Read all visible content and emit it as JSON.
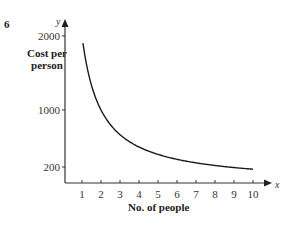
{
  "question_number": "6",
  "chart_data": {
    "type": "line",
    "title": "",
    "xlabel": "No. of people",
    "ylabel": "Cost per person",
    "x_axis_symbol": "x",
    "y_axis_symbol": "y",
    "x_ticks": [
      1,
      2,
      3,
      4,
      5,
      6,
      7,
      8,
      9,
      10
    ],
    "y_ticks": [
      200,
      1000,
      2000
    ],
    "xlim": [
      0,
      11
    ],
    "ylim": [
      0,
      2200
    ],
    "grid": false,
    "legend": null,
    "series": [
      {
        "name": "Cost per person",
        "x": [
          1,
          1.5,
          2,
          2.5,
          3,
          4,
          5,
          6,
          7,
          8,
          9,
          10
        ],
        "values": [
          2000,
          1333,
          1000,
          800,
          667,
          500,
          400,
          333,
          286,
          250,
          222,
          200
        ]
      }
    ],
    "color": "#1a1a1a"
  }
}
